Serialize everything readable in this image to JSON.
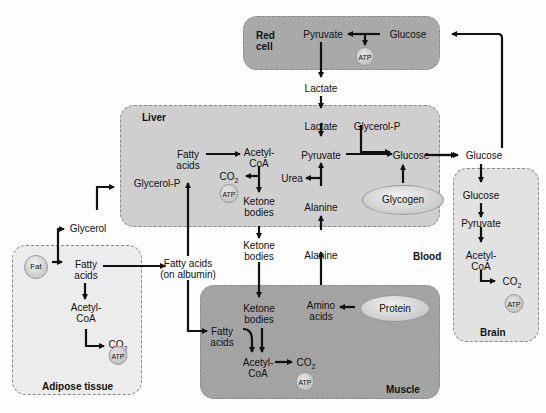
{
  "compartments": {
    "red_cell": {
      "title": "Red cell",
      "color": "#a9a9a9"
    },
    "liver": {
      "title": "Liver",
      "color": "#cfcfcf"
    },
    "muscle": {
      "title": "Muscle",
      "color": "#a3a3a3"
    },
    "brain": {
      "title": "Brain",
      "color": "#e2e2e2"
    },
    "adipose": {
      "title": "Adipose tissue",
      "color": "#ececec"
    },
    "blood": {
      "title": "Blood"
    }
  },
  "red_cell": {
    "pyruvate": "Pyruvate",
    "glucose": "Glucose",
    "atp": "ATP"
  },
  "blood_labels": {
    "lactate": "Lactate",
    "glucose": "Glucose",
    "glycerol": "Glycerol",
    "fatty_acids_albumin_1": "Fatty acids",
    "fatty_acids_albumin_2": "(on albumin)",
    "ketone_1": "Ketone",
    "ketone_2": "bodies",
    "alanine": "Alanine"
  },
  "liver": {
    "fatty_1": "Fatty",
    "fatty_2": "acids",
    "acetyl_1": "Acetyl-",
    "acetyl_2": "CoA",
    "co2": "CO",
    "co2_sub": "2",
    "atp": "ATP",
    "ketone_1": "Ketone",
    "ketone_2": "bodies",
    "glycerol_p_in": "Glycerol-P",
    "lactate": "Lactate",
    "pyruvate": "Pyruvate",
    "urea": "Urea",
    "alanine": "Alanine",
    "glycerol_p": "Glycerol-P",
    "glucose": "Glucose",
    "glycogen": "Glycogen"
  },
  "brain": {
    "glucose": "Glucose",
    "pyruvate": "Pyruvate",
    "acetyl_1": "Acetyl-",
    "acetyl_2": "CoA",
    "co2": "CO",
    "co2_sub": "2",
    "atp": "ATP"
  },
  "adipose": {
    "fat": "Fat",
    "fatty_1": "Fatty",
    "fatty_2": "acids",
    "acetyl_1": "Acetyl-",
    "acetyl_2": "CoA",
    "co2": "CO",
    "co2_sub": "2",
    "atp": "ATP"
  },
  "muscle": {
    "ketone_1": "Ketone",
    "ketone_2": "bodies",
    "amino_1": "Amino",
    "amino_2": "acids",
    "protein": "Protein",
    "fatty_1": "Fatty",
    "fatty_2": "acids",
    "acetyl_1": "Acetyl-",
    "acetyl_2": "CoA",
    "co2": "CO",
    "co2_sub": "2",
    "atp": "ATP"
  }
}
